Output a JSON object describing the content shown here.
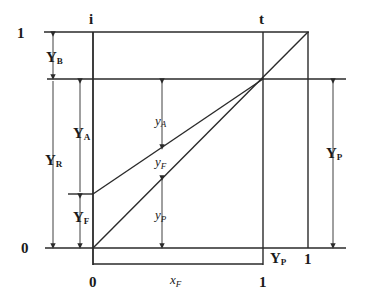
{
  "diagram": {
    "type": "distillation-fraction-diagram",
    "top_labels": {
      "i": "i",
      "t": "t"
    },
    "axis_left": {
      "top": "1",
      "bottom": "0"
    },
    "axis_bottom": {
      "origin": "0",
      "one_under_t": "1",
      "one_under_right": "1"
    },
    "capital_labels": {
      "YB": {
        "main": "Y",
        "sub": "B"
      },
      "YA": {
        "main": "Y",
        "sub": "A"
      },
      "YR": {
        "main": "Y",
        "sub": "R"
      },
      "YF": {
        "main": "Y",
        "sub": "F"
      },
      "YP_right": {
        "main": "Y",
        "sub": "P"
      },
      "YP_bottom": {
        "main": "Y",
        "sub": "P"
      }
    },
    "lower_labels": {
      "yA": {
        "main": "y",
        "sub": "A"
      },
      "yF": {
        "main": "y",
        "sub": "F"
      },
      "yP": {
        "main": "y",
        "sub": "P"
      },
      "xF": {
        "main": "x",
        "sub": "F"
      }
    },
    "line_color": "#2a2a2a"
  }
}
